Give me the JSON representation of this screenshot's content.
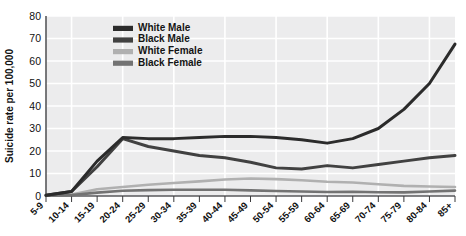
{
  "chart_data": {
    "type": "line",
    "title": "",
    "xlabel": "",
    "ylabel": "Suicide rate per 100,000",
    "ylim": [
      0,
      80
    ],
    "yticks": [
      0,
      10,
      20,
      30,
      40,
      50,
      60,
      70,
      80
    ],
    "grid": true,
    "legend_position": "top-center",
    "categories": [
      "5-9",
      "10-14",
      "15-19",
      "20-24",
      "25-29",
      "30-34",
      "35-39",
      "40-44",
      "45-49",
      "50-54",
      "55-59",
      "60-64",
      "65-69",
      "70-74",
      "75-79",
      "80-84",
      "85+"
    ],
    "series": [
      {
        "name": "White Male",
        "color": "#2b2b2b",
        "values": [
          0.3,
          2.0,
          15.5,
          26.0,
          25.5,
          25.5,
          26.0,
          26.5,
          26.5,
          26.0,
          25.0,
          23.5,
          25.5,
          30.0,
          38.5,
          50.0,
          67.5
        ]
      },
      {
        "name": "Black Male",
        "color": "#414141",
        "values": [
          0.3,
          2.0,
          13.0,
          25.5,
          22.0,
          20.0,
          18.0,
          17.0,
          15.0,
          12.5,
          12.0,
          13.5,
          12.5,
          14.0,
          15.5,
          17.0,
          18.0
        ]
      },
      {
        "name": "White Female",
        "color": "#b0b0b0",
        "values": [
          0.2,
          0.7,
          3.0,
          4.0,
          5.0,
          5.8,
          6.5,
          7.3,
          7.8,
          7.5,
          7.0,
          6.3,
          6.0,
          5.2,
          4.5,
          4.2,
          4.0
        ]
      },
      {
        "name": "Black Female",
        "color": "#737373",
        "values": [
          0.1,
          0.4,
          1.5,
          2.3,
          2.6,
          2.8,
          2.8,
          2.8,
          2.5,
          2.2,
          2.0,
          1.8,
          1.9,
          1.7,
          1.6,
          2.0,
          2.4
        ]
      }
    ]
  },
  "legend": {
    "entries": [
      {
        "label": "White Male"
      },
      {
        "label": "Black Male"
      },
      {
        "label": "White Female"
      },
      {
        "label": "Black Female"
      }
    ]
  },
  "axes": {
    "y_title": "Suicide rate per 100,000"
  },
  "colors": {
    "plot_background": "#ececed",
    "gridline": "#ffffff",
    "axis": "#58595b",
    "text": "#111111"
  }
}
